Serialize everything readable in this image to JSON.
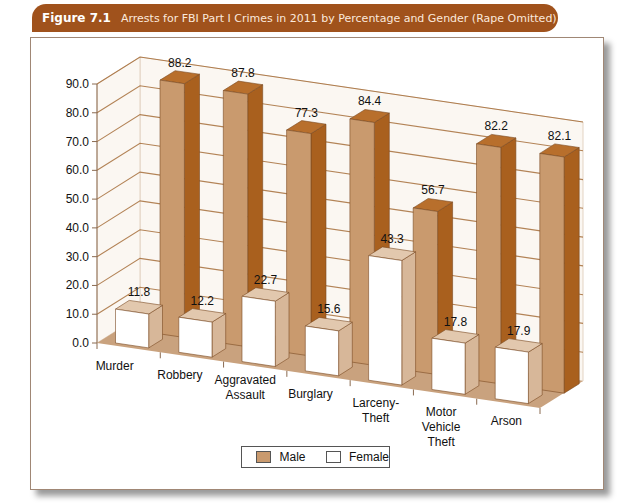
{
  "header": {
    "figure_label": "Figure 7.1",
    "caption": "Arrests for FBI Part I Crimes in 2011 by Percentage and Gender (Rape Omitted)"
  },
  "colors": {
    "header_bg": "#a0521c",
    "male_front": "#c99a6e",
    "male_side": "#a9601e",
    "male_top": "#b86f2c",
    "female_front": "#ffffff",
    "female_side": "#d7b799",
    "floor": "#c9a27e",
    "wall": "#fbf7f2",
    "grid": "#a0652e"
  },
  "legend": {
    "items": [
      {
        "label": "Male"
      },
      {
        "label": "Female"
      }
    ]
  },
  "chart_data": {
    "type": "bar",
    "title": "Arrests for FBI Part I Crimes in 2011 by Percentage and Gender (Rape Omitted)",
    "xlabel": "",
    "ylabel": "",
    "ylim": [
      0,
      90
    ],
    "yticks": [
      "0.0",
      "10.0",
      "20.0",
      "30.0",
      "40.0",
      "50.0",
      "60.0",
      "70.0",
      "80.0",
      "90.0"
    ],
    "grid": true,
    "legend_position": "bottom",
    "style": "3d-clustered",
    "categories": [
      "Murder",
      "Robbery",
      "Aggravated Assault",
      "Burglary",
      "Larceny-Theft",
      "Motor Vehicle Theft",
      "Arson"
    ],
    "category_label_lines": [
      [
        "Murder"
      ],
      [
        "Robbery"
      ],
      [
        "Aggravated",
        "Assault"
      ],
      [
        "Burglary"
      ],
      [
        "Larceny-",
        "Theft"
      ],
      [
        "Motor",
        "Vehicle",
        "Theft"
      ],
      [
        "Arson"
      ]
    ],
    "series": [
      {
        "name": "Male",
        "values": [
          88.2,
          87.8,
          77.3,
          84.4,
          56.7,
          82.2,
          82.1
        ]
      },
      {
        "name": "Female",
        "values": [
          11.8,
          12.2,
          22.7,
          15.6,
          43.3,
          17.8,
          17.9
        ]
      }
    ],
    "value_labels": {
      "Male": [
        "88.2",
        "87.8",
        "77.3",
        "84.4",
        "56.7",
        "82.2",
        "82.1"
      ],
      "Female": [
        "11.8",
        "12.2",
        "22.7",
        "15.6",
        "43.3",
        "17.8",
        "17.9"
      ]
    }
  }
}
